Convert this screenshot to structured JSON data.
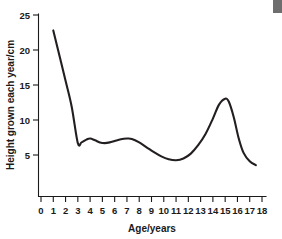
{
  "chart_data": {
    "type": "line",
    "title": "",
    "xlabel": "Age/years",
    "ylabel": "Height grown each year/cm",
    "xlim": [
      0,
      18
    ],
    "ylim": [
      0,
      25
    ],
    "grid": false,
    "legend": null,
    "x_ticks": [
      "0",
      "1",
      "2",
      "3",
      "4",
      "5",
      "6",
      "7",
      "8",
      "9",
      "10",
      "11",
      "12",
      "13",
      "14",
      "15",
      "16",
      "17",
      "18"
    ],
    "y_ticks": [
      "5",
      "10",
      "15",
      "20",
      "25"
    ],
    "series": [
      {
        "name": "Growth velocity",
        "color": "#231f20",
        "x": [
          1.0,
          1.5,
          2.0,
          2.5,
          3.0,
          3.3,
          3.7,
          4.0,
          4.4,
          4.8,
          5.2,
          5.6,
          6.0,
          6.5,
          7.0,
          7.4,
          8.0,
          8.6,
          9.2,
          9.8,
          10.4,
          11.0,
          11.6,
          12.2,
          12.8,
          13.4,
          14.0,
          14.5,
          15.0,
          15.3,
          15.7,
          16.1,
          16.5,
          17.0,
          17.5
        ],
        "y": [
          22.8,
          19.2,
          15.6,
          11.9,
          6.7,
          6.8,
          7.2,
          7.35,
          7.1,
          6.8,
          6.7,
          6.8,
          7.0,
          7.25,
          7.35,
          7.3,
          6.8,
          6.1,
          5.4,
          4.8,
          4.4,
          4.25,
          4.5,
          5.2,
          6.4,
          8.0,
          10.2,
          12.2,
          13.05,
          12.6,
          10.4,
          7.4,
          5.3,
          4.1,
          3.55
        ]
      }
    ],
    "annotations": {
      "infant_start_value": 22.8,
      "childhood_plateau_range": [
        6.7,
        7.35
      ],
      "prepubertal_minimum": 4.25,
      "prepubertal_minimum_age": 11.0,
      "peak_height_velocity": 13.05,
      "peak_height_velocity_age": 15.0,
      "final_value": 3.55
    }
  },
  "figure": {
    "corner_mark_name": "page-corner-mark"
  }
}
